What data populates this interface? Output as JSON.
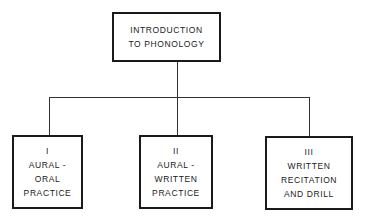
{
  "diagram": {
    "root": {
      "lines": [
        "INTRODUCTION",
        "TO PHONOLOGY"
      ]
    },
    "children": [
      {
        "numeral": "I",
        "lines": [
          "AURAL -",
          "ORAL",
          "PRACTICE"
        ]
      },
      {
        "numeral": "II",
        "lines": [
          "AURAL -",
          "WRITTEN",
          "PRACTICE"
        ]
      },
      {
        "numeral": "III",
        "lines": [
          "WRITTEN",
          "RECITATION",
          "AND DRILL"
        ]
      }
    ],
    "colors": {
      "stroke": "#1a1a1a",
      "background": "#ffffff"
    }
  }
}
